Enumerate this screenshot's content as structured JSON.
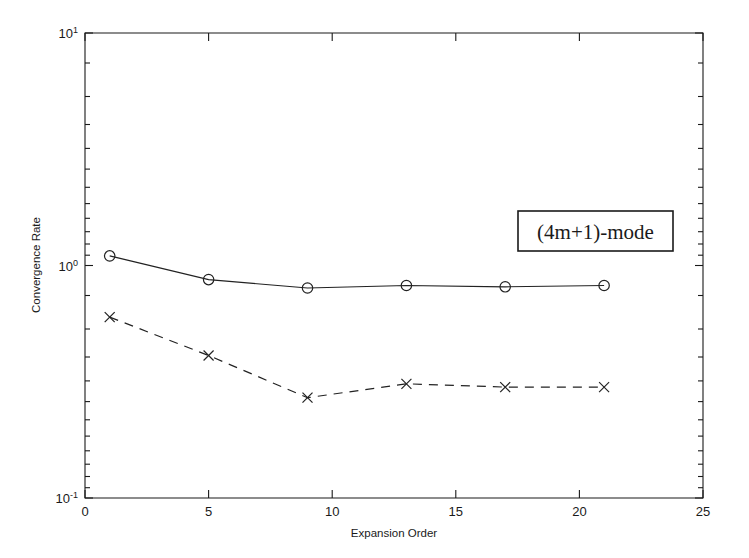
{
  "chart_data": {
    "type": "line",
    "title": "",
    "xlabel": "Expansion Order",
    "ylabel": "Convergence Rate",
    "yscale": "log",
    "xlim": [
      0,
      25
    ],
    "ylim": [
      0.1,
      10
    ],
    "grid": false,
    "x_ticks": [
      0,
      5,
      10,
      15,
      20,
      25
    ],
    "x_tick_labels": [
      "0",
      "5",
      "10",
      "15",
      "20",
      "25"
    ],
    "y_ticks": [
      0.1,
      1,
      10
    ],
    "y_tick_labels": [
      "10^-1",
      "10^0",
      "10^1"
    ],
    "y_tick_mantissa": "10",
    "y_tick_exponents": [
      "-1",
      "0",
      "1"
    ],
    "x": [
      1,
      5,
      9,
      13,
      17,
      21
    ],
    "series": [
      {
        "name": "solid-circle-series",
        "marker": "circle",
        "linestyle": "solid",
        "values": [
          1.1,
          0.87,
          0.8,
          0.82,
          0.81,
          0.82
        ]
      },
      {
        "name": "dashed-cross-series",
        "marker": "x",
        "linestyle": "dashed",
        "values": [
          0.6,
          0.41,
          0.27,
          0.31,
          0.3,
          0.3
        ]
      }
    ],
    "annotations": [
      {
        "name": "mode-label",
        "text": "(4m+1)-mode",
        "boxed": true,
        "x": 18.2,
        "y": 2.0
      }
    ],
    "colors": {
      "axis": "#1a1a1a",
      "series": "#222222",
      "background": "#ffffff"
    }
  }
}
